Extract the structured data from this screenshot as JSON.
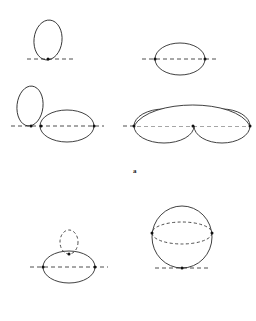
{
  "figure": {
    "domain": "Diagram",
    "width": 256,
    "height": 321,
    "background_color": "#ffffff",
    "stroke_color": "#2b2b2b",
    "dash_color": "#3a3a3a",
    "vertex_color": "#111111",
    "panel_label": {
      "text": "a",
      "x": 133,
      "y": 168,
      "font_size": 7
    },
    "panels": [
      {
        "id": "panel-top-left",
        "name": "vertical-loop-tangent-to-axis",
        "axis": {
          "x1": 27,
          "y1": 59,
          "x2": 74,
          "y2": 59,
          "style": "dashed"
        },
        "solid_ellipses": [
          {
            "cx": 48,
            "cy": 40,
            "rx": 14,
            "ry": 20,
            "rotation": 6
          }
        ],
        "dashed_ellipses": [],
        "vertices": [
          {
            "x": 48,
            "y": 59
          }
        ]
      },
      {
        "id": "panel-top-right",
        "name": "horizontal-loop-crossing-axis",
        "axis": {
          "x1": 142,
          "y1": 59,
          "x2": 219,
          "y2": 59,
          "style": "dashed"
        },
        "solid_ellipses": [
          {
            "cx": 180,
            "cy": 59,
            "rx": 25,
            "ry": 16,
            "rotation": 0
          }
        ],
        "dashed_ellipses": [],
        "vertices": [
          {
            "x": 155,
            "y": 59
          },
          {
            "x": 205,
            "y": 59
          }
        ]
      },
      {
        "id": "panel-middle-left",
        "name": "vertical-loop-plus-horizontal-loop",
        "axis": {
          "x1": 11,
          "y1": 126,
          "x2": 104,
          "y2": 126,
          "style": "dashed"
        },
        "solid_ellipses": [
          {
            "cx": 30,
            "cy": 106,
            "rx": 13,
            "ry": 20,
            "rotation": 6
          },
          {
            "cx": 67,
            "cy": 126,
            "rx": 27,
            "ry": 16,
            "rotation": 0
          }
        ],
        "dashed_ellipses": [],
        "vertices": [
          {
            "x": 31,
            "y": 126
          },
          {
            "x": 41,
            "y": 126
          },
          {
            "x": 94,
            "y": 126
          }
        ]
      },
      {
        "id": "panel-middle-right",
        "name": "double-lobe-loop-on-axis",
        "axis": {
          "x1": 123,
          "y1": 126,
          "x2": 246,
          "y2": 126,
          "style": "dashed"
        },
        "solid_ellipses": [
          {
            "cx": 164,
            "cy": 126,
            "rx": 30,
            "ry": 17,
            "rotation": 0
          },
          {
            "cx": 222,
            "cy": 126,
            "rx": 28,
            "ry": 17,
            "rotation": 0
          }
        ],
        "dashed_ellipses": [],
        "upper_arc": {
          "x1": 134,
          "y1": 126,
          "cx1": 150,
          "cy1": 98,
          "cx2": 236,
          "cy2": 98,
          "x2": 250,
          "y2": 126
        },
        "vertices": [
          {
            "x": 134,
            "y": 126
          },
          {
            "x": 193,
            "y": 126
          },
          {
            "x": 250,
            "y": 126
          }
        ]
      },
      {
        "id": "panel-bottom-left",
        "name": "horizontal-loop-with-dashed-tadpole",
        "axis": {
          "x1": 30,
          "y1": 267,
          "x2": 108,
          "y2": 267,
          "style": "dashed"
        },
        "solid_ellipses": [
          {
            "cx": 69,
            "cy": 267,
            "rx": 26,
            "ry": 16,
            "rotation": 0
          }
        ],
        "dashed_ellipses": [
          {
            "cx": 69,
            "cy": 242,
            "rx": 9,
            "ry": 12,
            "rotation": 0
          }
        ],
        "vertices": [
          {
            "x": 43,
            "y": 267
          },
          {
            "x": 95,
            "y": 267
          },
          {
            "x": 69,
            "y": 254
          }
        ]
      },
      {
        "id": "panel-bottom-right",
        "name": "vertical-loop-with-dashed-equator",
        "axis": {
          "x1": 155,
          "y1": 268,
          "x2": 208,
          "y2": 268,
          "style": "dashed"
        },
        "solid_ellipses": [
          {
            "cx": 182,
            "cy": 237,
            "rx": 30,
            "ry": 31,
            "rotation": 0
          }
        ],
        "dashed_ellipses": [
          {
            "cx": 182,
            "cy": 233,
            "rx": 30,
            "ry": 11,
            "rotation": 0
          }
        ],
        "vertices": [
          {
            "x": 182,
            "y": 268
          },
          {
            "x": 152,
            "y": 233
          },
          {
            "x": 212,
            "y": 233
          }
        ]
      }
    ]
  }
}
